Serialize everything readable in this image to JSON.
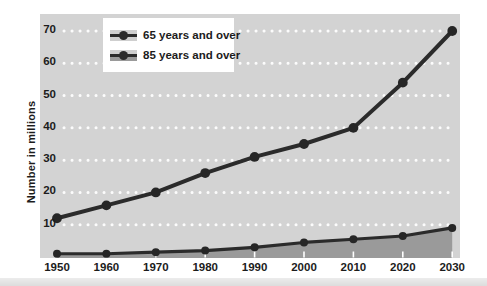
{
  "chart_data": {
    "type": "line",
    "title": "",
    "xlabel": "",
    "ylabel": "Number in millions",
    "x": [
      1950,
      1960,
      1970,
      1980,
      1990,
      2000,
      2010,
      2020,
      2030
    ],
    "series": [
      {
        "name": "65 years and over",
        "type": "line-markers",
        "values": [
          12,
          16,
          20,
          26,
          31,
          35,
          40,
          54,
          70
        ]
      },
      {
        "name": "85 years and over",
        "type": "area-line-markers",
        "values": [
          1,
          1,
          1.5,
          2,
          3,
          4.5,
          5.5,
          6.5,
          9
        ]
      }
    ],
    "ylim": [
      0,
      70
    ],
    "yticks": [
      10,
      20,
      30,
      40,
      50,
      60,
      70
    ],
    "grid": "horizontal-dotted-white",
    "legend_position": "top-left-inside",
    "colors": {
      "line": "#2b2b2b",
      "marker": "#262626",
      "area_fill": "#9a9a9a",
      "plot_bg": "#d3d3d3",
      "grid_dots": "#ffffff",
      "axis_tick": "#ffffff",
      "text": "#1c1c1c",
      "legend_bg": "#ffffff"
    }
  }
}
